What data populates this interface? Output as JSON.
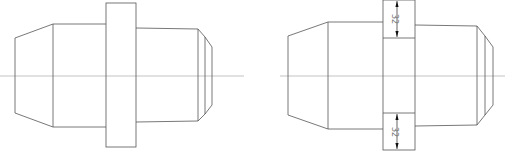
{
  "drawing": {
    "stroke_color": "#555555",
    "centerline_color": "#9a9a9a",
    "background": "#ffffff",
    "views": [
      {
        "name": "shaft-view-left",
        "centerline": {
          "x1": 0,
          "x2": 244,
          "y": 76
        },
        "left_cone": {
          "face_x": 15,
          "face_top": 38,
          "face_bottom": 113,
          "step_x": 53,
          "step_top": 24,
          "step_bottom": 127
        },
        "flange": {
          "x": 106,
          "y": 3,
          "w": 30,
          "h": 144
        },
        "right_body": {
          "x1": 136,
          "x2": 198,
          "top": 28,
          "bottom": 122
        },
        "chamfer": {
          "inner_x": 205,
          "inner_top": 37,
          "inner_bottom": 114,
          "tip_x": 212,
          "tip_top": 47,
          "tip_bottom": 105
        }
      },
      {
        "name": "shaft-view-right",
        "centerline": {
          "x1": 280,
          "x2": 505,
          "y": 76
        },
        "left_cone": {
          "face_x": 288,
          "face_top": 36,
          "face_bottom": 115,
          "step_x": 328,
          "step_top": 22,
          "step_bottom": 129
        },
        "flange": {
          "x": 383,
          "y": 0,
          "w": 32,
          "h": 150,
          "inner_top": 38,
          "inner_bottom": 113
        },
        "right_body": {
          "x1": 415,
          "x2": 477,
          "top": 25,
          "bottom": 126
        },
        "chamfer": {
          "inner_x": 485,
          "inner_top": 36,
          "inner_bottom": 115,
          "tip_x": 493,
          "tip_top": 47,
          "tip_bottom": 105
        }
      }
    ],
    "dimensions": [
      {
        "name": "flange-top-height",
        "text": "32",
        "x": 397,
        "y1": 1,
        "y2": 37
      },
      {
        "name": "flange-bottom-height",
        "text": "32",
        "x": 397,
        "y1": 114,
        "y2": 149
      }
    ]
  }
}
